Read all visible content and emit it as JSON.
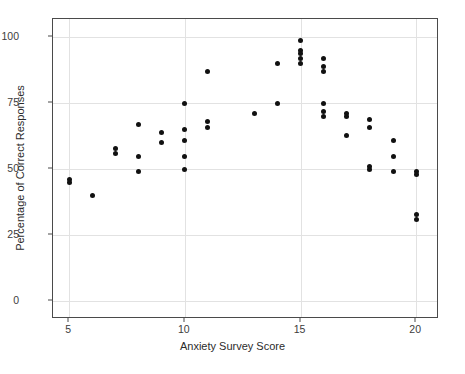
{
  "chart_data": {
    "type": "scatter",
    "title": "",
    "xlabel": "Anxiety Survey Score",
    "ylabel": "Percentage of Correct Responses",
    "xlim": [
      4.3,
      20.9
    ],
    "ylim": [
      -6,
      107
    ],
    "xticks": [
      5,
      10,
      15,
      20
    ],
    "xtick_labels": [
      "5",
      "10",
      "15",
      "20"
    ],
    "yticks": [
      0,
      25,
      50,
      75,
      100
    ],
    "ytick_labels": [
      "0",
      "25",
      "50",
      "75",
      "100"
    ],
    "grid": "both",
    "legend": "none",
    "marker": "filled-circle",
    "marker_color": "#111111",
    "panel_background": "#ffffff",
    "grid_color": "#e2e2e2",
    "border_color": "#4a4a4a",
    "points": [
      {
        "x": 5,
        "y": 46
      },
      {
        "x": 5,
        "y": 45
      },
      {
        "x": 6,
        "y": 40
      },
      {
        "x": 7,
        "y": 58
      },
      {
        "x": 7,
        "y": 56
      },
      {
        "x": 8,
        "y": 67
      },
      {
        "x": 8,
        "y": 55
      },
      {
        "x": 8,
        "y": 49
      },
      {
        "x": 9,
        "y": 64
      },
      {
        "x": 9,
        "y": 60
      },
      {
        "x": 10,
        "y": 75
      },
      {
        "x": 10,
        "y": 65
      },
      {
        "x": 10,
        "y": 61
      },
      {
        "x": 10,
        "y": 55
      },
      {
        "x": 10,
        "y": 50
      },
      {
        "x": 11,
        "y": 87
      },
      {
        "x": 11,
        "y": 68
      },
      {
        "x": 11,
        "y": 66
      },
      {
        "x": 13,
        "y": 71
      },
      {
        "x": 14,
        "y": 90
      },
      {
        "x": 14,
        "y": 75
      },
      {
        "x": 15,
        "y": 99
      },
      {
        "x": 15,
        "y": 95
      },
      {
        "x": 15,
        "y": 94
      },
      {
        "x": 15,
        "y": 92
      },
      {
        "x": 15,
        "y": 90
      },
      {
        "x": 16,
        "y": 92
      },
      {
        "x": 16,
        "y": 89
      },
      {
        "x": 16,
        "y": 87
      },
      {
        "x": 16,
        "y": 75
      },
      {
        "x": 16,
        "y": 72
      },
      {
        "x": 16,
        "y": 70
      },
      {
        "x": 17,
        "y": 71
      },
      {
        "x": 17,
        "y": 70
      },
      {
        "x": 17,
        "y": 63
      },
      {
        "x": 18,
        "y": 69
      },
      {
        "x": 18,
        "y": 66
      },
      {
        "x": 18,
        "y": 51
      },
      {
        "x": 18,
        "y": 50
      },
      {
        "x": 19,
        "y": 61
      },
      {
        "x": 19,
        "y": 55
      },
      {
        "x": 19,
        "y": 49
      },
      {
        "x": 20,
        "y": 49
      },
      {
        "x": 20,
        "y": 48
      },
      {
        "x": 20,
        "y": 33
      },
      {
        "x": 20,
        "y": 31
      }
    ]
  }
}
